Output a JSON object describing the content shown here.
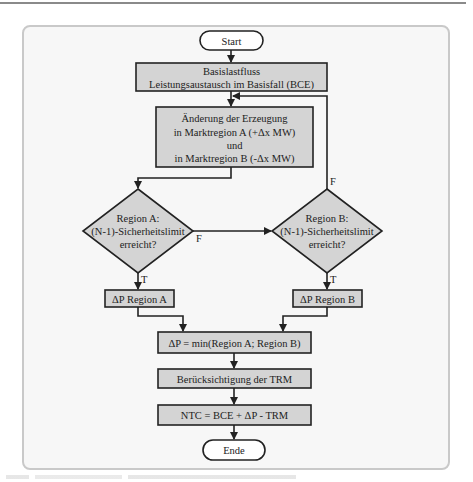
{
  "diagram": {
    "type": "flowchart",
    "colors": {
      "box_fill": "#d4d4d4",
      "terminal_fill": "#ffffff",
      "stroke": "#222222",
      "frame_bg": "#f7f7f7",
      "frame_border": "#c9c9c9"
    },
    "nodes": {
      "start": {
        "label": "Start",
        "shape": "terminal"
      },
      "base_flow": {
        "line1": "Basislastfluss",
        "line2": "Leistungsaustausch im Basisfall (BCE)",
        "shape": "process"
      },
      "change_generation": {
        "line1": "Änderung der Erzeugung",
        "line2": "in Marktregion A (+Δx MW)",
        "line3": "und",
        "line4": "in Marktregion B (-Δx MW)",
        "shape": "process"
      },
      "decision_a": {
        "line1": "Region A:",
        "line2": "(N-1)-Sicherheitslimit",
        "line3": "erreicht?",
        "shape": "decision"
      },
      "decision_b": {
        "line1": "Region B:",
        "line2": "(N-1)-Sicherheitslimit",
        "line3": "erreicht?",
        "shape": "decision"
      },
      "dp_a": {
        "label": "ΔP Region A",
        "shape": "process"
      },
      "dp_b": {
        "label": "ΔP Region B",
        "shape": "process"
      },
      "dp_min": {
        "label": "ΔP = min(Region A; Region B)",
        "shape": "process"
      },
      "trm": {
        "label": "Berücksichtigung der TRM",
        "shape": "process"
      },
      "ntc": {
        "label": "NTC = BCE + ΔP - TRM",
        "shape": "process"
      },
      "end": {
        "label": "Ende",
        "shape": "terminal"
      }
    },
    "edge_labels": {
      "a_false": "F",
      "a_true": "T",
      "b_false": "F",
      "b_true": "T"
    },
    "edges": [
      [
        "start",
        "base_flow"
      ],
      [
        "base_flow",
        "change_generation"
      ],
      [
        "change_generation",
        "decision_a"
      ],
      [
        "decision_a",
        "decision_b",
        "F"
      ],
      [
        "decision_a",
        "dp_a",
        "T"
      ],
      [
        "decision_b",
        "change_generation",
        "F"
      ],
      [
        "decision_b",
        "dp_b",
        "T"
      ],
      [
        "dp_a",
        "dp_min"
      ],
      [
        "dp_b",
        "dp_min"
      ],
      [
        "dp_min",
        "trm"
      ],
      [
        "trm",
        "ntc"
      ],
      [
        "ntc",
        "end"
      ]
    ]
  }
}
